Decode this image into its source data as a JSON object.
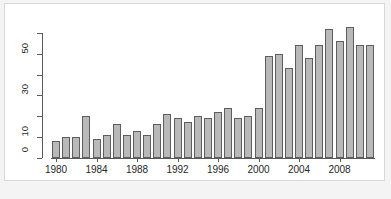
{
  "chart_data": {
    "type": "bar",
    "title": "",
    "subtitle": "",
    "xlabel": "",
    "ylabel": "",
    "categories": [
      1980,
      1981,
      1982,
      1983,
      1984,
      1985,
      1986,
      1987,
      1988,
      1989,
      1990,
      1991,
      1992,
      1993,
      1994,
      1995,
      1996,
      1997,
      1998,
      1999,
      2000,
      2001,
      2002,
      2003,
      2004,
      2005,
      2006,
      2007,
      2008,
      2009,
      2010,
      2011
    ],
    "values": [
      8,
      10,
      10,
      20,
      9,
      11,
      16,
      11,
      13,
      11,
      16,
      21,
      19,
      17,
      20,
      19,
      22,
      24,
      19,
      20,
      24,
      49,
      50,
      43,
      54,
      48,
      54,
      62,
      56,
      63,
      54,
      54
    ],
    "ylim": [
      0,
      62
    ],
    "y_ticks": [
      0,
      10,
      20,
      30,
      40,
      50,
      60
    ],
    "y_tick_labels": [
      "0",
      "10",
      "",
      "30",
      "",
      "50",
      ""
    ],
    "x_tick_labels": [
      "1980",
      "1984",
      "1988",
      "1992",
      "1996",
      "2000",
      "2004",
      "2008"
    ],
    "x_tick_years": [
      1980,
      1984,
      1988,
      1992,
      1996,
      2000,
      2004,
      2008
    ],
    "grid": false,
    "legend": null,
    "bar_fill": "#b9b9b9",
    "bar_border": "#5e5e5e",
    "axis_color": "#5a5a5a",
    "background": "#ffffff"
  },
  "figure": {
    "caption": ""
  }
}
